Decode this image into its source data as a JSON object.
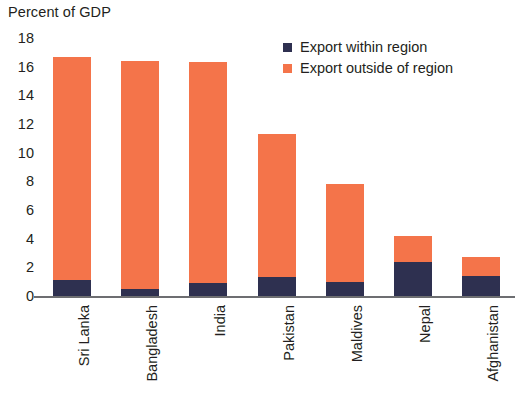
{
  "chart_data": {
    "type": "bar",
    "subtype": "stacked-vertical",
    "title": "Percent of GDP",
    "xlabel": "",
    "ylabel": "",
    "ylim": [
      0,
      18
    ],
    "ytick_step": 2,
    "yticks": [
      18,
      16,
      14,
      12,
      10,
      8,
      6,
      4,
      2,
      0
    ],
    "grid": false,
    "legend_position": "top-right",
    "categories": [
      "Sri Lanka",
      "Bangladesh",
      "India",
      "Pakistan",
      "Maldives",
      "Nepal",
      "Afghanistan"
    ],
    "series": [
      {
        "name": "Export within region",
        "color": "#2e3050",
        "values": [
          1.1,
          0.5,
          0.9,
          1.3,
          1.0,
          2.4,
          1.4
        ]
      },
      {
        "name": "Export outside of region",
        "color": "#f4744a",
        "values": [
          15.6,
          15.9,
          15.4,
          10.0,
          6.8,
          1.8,
          1.3
        ]
      }
    ],
    "totals": [
      16.7,
      16.4,
      16.3,
      11.3,
      7.8,
      4.2,
      2.7
    ]
  },
  "axis": {
    "baseline_color": "#6d6e71"
  }
}
